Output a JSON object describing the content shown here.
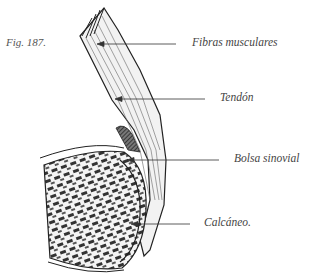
{
  "figure": {
    "number_label": "Fig. 187."
  },
  "labels": [
    {
      "id": "fibras",
      "text": "Fibras musculares",
      "x": 192,
      "y": 36,
      "arrow_from": [
        176,
        44
      ],
      "arrow_to": [
        98,
        44
      ]
    },
    {
      "id": "tendon",
      "text": "Tendón",
      "x": 220,
      "y": 91,
      "arrow_from": [
        205,
        99
      ],
      "arrow_to": [
        116,
        99
      ]
    },
    {
      "id": "bolsa",
      "text": "Bolsa sinovial",
      "x": 234,
      "y": 152,
      "arrow_from": [
        219,
        160
      ],
      "arrow_to": [
        128,
        160
      ]
    },
    {
      "id": "calcaneo",
      "text": "Calcáneo.",
      "x": 204,
      "y": 216,
      "arrow_from": [
        190,
        224
      ],
      "arrow_to": [
        132,
        224
      ]
    }
  ],
  "colors": {
    "ink": "#2a2a2a",
    "text": "#444444",
    "background": "#ffffff"
  }
}
